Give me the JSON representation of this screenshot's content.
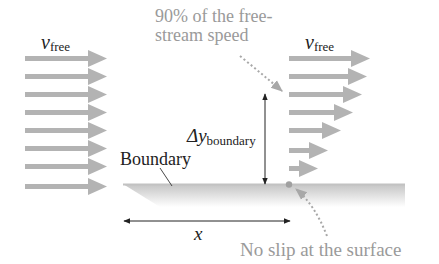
{
  "diagram": {
    "type": "boundary-layer flow",
    "colors": {
      "arrow": "#b3b3b3",
      "annotation": "#9a9a9a",
      "text": "#222222",
      "plate": "#c9c9c9",
      "dot": "#a0a0a0"
    },
    "labels": {
      "v_free_left": {
        "symbol": "v",
        "subscript": "free"
      },
      "v_free_right": {
        "symbol": "v",
        "subscript": "free"
      },
      "delta_y": {
        "symbol": "Δy",
        "subscript": "boundary"
      },
      "boundary": "Boundary",
      "x": "x",
      "ninety_percent_line1": "90% of the free-",
      "ninety_percent_line2": "stream speed",
      "no_slip": "No slip at the surface"
    },
    "left_arrows": {
      "count": 8,
      "x_start": 25,
      "x_end": 107,
      "y": [
        58,
        76,
        94,
        112,
        130,
        148,
        166,
        186
      ]
    },
    "right_arrows": {
      "count": 7,
      "x_start": 289,
      "x_end": [
        370,
        367,
        362,
        353,
        341,
        328,
        318
      ],
      "y": [
        58,
        76,
        94,
        112,
        130,
        150,
        168
      ]
    }
  }
}
